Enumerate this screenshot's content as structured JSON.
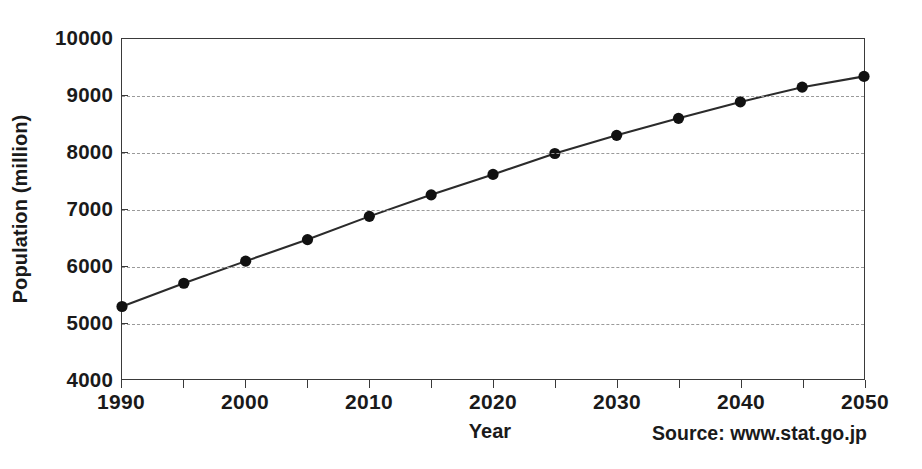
{
  "chart_data": {
    "type": "line",
    "title": "",
    "xlabel": "Year",
    "ylabel": "Population (million)",
    "xlim": [
      1990,
      2050
    ],
    "ylim": [
      4000,
      10000
    ],
    "grid": "horizontal-dashed",
    "legend": "none",
    "marker": "filled-circle",
    "x": [
      1990,
      1995,
      2000,
      2005,
      2010,
      2015,
      2020,
      2025,
      2030,
      2035,
      2040,
      2045,
      2050
    ],
    "values": [
      5280,
      5690,
      6080,
      6460,
      6870,
      7250,
      7610,
      7980,
      8300,
      8600,
      8890,
      9150,
      9340
    ],
    "series": [
      {
        "name": "World population",
        "values": [
          5280,
          5690,
          6080,
          6460,
          6870,
          7250,
          7610,
          7980,
          8300,
          8600,
          8890,
          9150,
          9340
        ]
      }
    ],
    "xticks": [
      1990,
      1995,
      2000,
      2005,
      2010,
      2015,
      2020,
      2025,
      2030,
      2035,
      2040,
      2045,
      2050
    ],
    "xtick_labels_shown": [
      "1990",
      "2000",
      "2010",
      "2020",
      "2030",
      "2040",
      "2050"
    ],
    "xtick_labels_shown_values": [
      1990,
      2000,
      2010,
      2020,
      2030,
      2040,
      2050
    ],
    "yticks": [
      4000,
      5000,
      6000,
      7000,
      8000,
      9000,
      10000
    ],
    "ytick_labels": [
      "4000",
      "5000",
      "6000",
      "7000",
      "8000",
      "9000",
      "10000"
    ],
    "gridline_values": [
      5000,
      6000,
      7000,
      8000,
      9000
    ],
    "annotations": [
      "Source: www.stat.go.jp"
    ],
    "colors": {
      "line": "#2b2b2b",
      "marker": "#111111",
      "grid": "#9a9a9a",
      "axis": "#3a3a3a",
      "background": "#ffffff",
      "text": "#1a1a1a"
    }
  },
  "axes": {
    "y_title": "Population (million)",
    "x_title": "Year"
  },
  "source": {
    "text": "Source: www.stat.go.jp"
  }
}
